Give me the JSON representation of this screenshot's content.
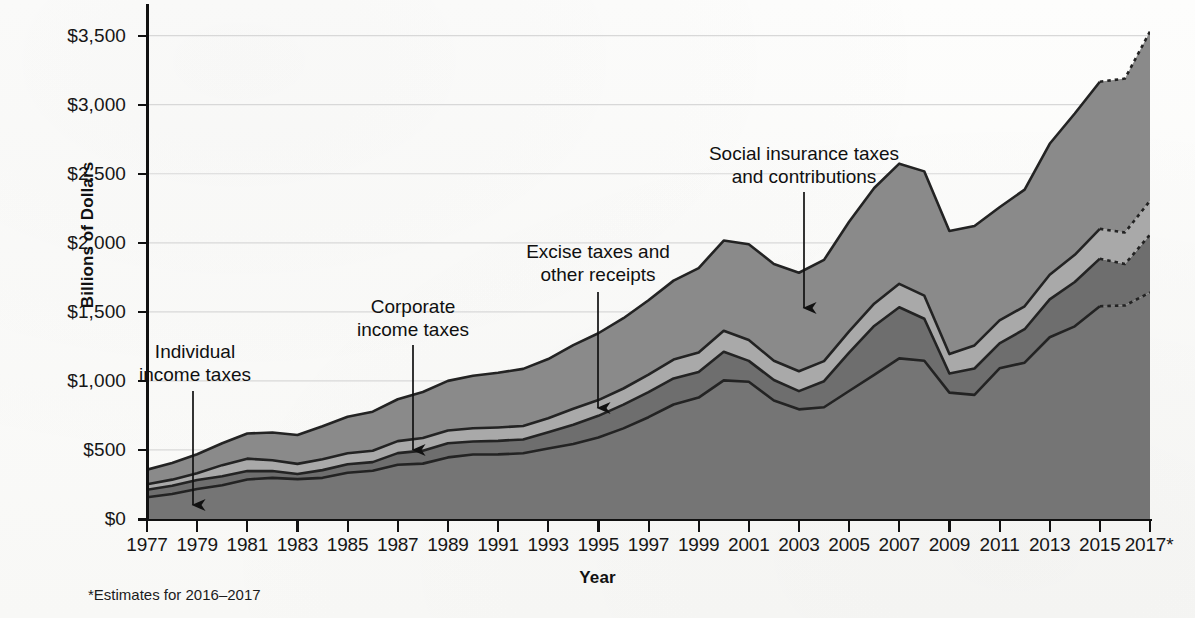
{
  "figure": {
    "axis_title_y": "Billions of Dollars",
    "axis_title_x": "Year",
    "footnote": "*Estimates for 2016–2017",
    "corner_mark": ""
  },
  "annotations": [
    {
      "id": "individual-income-taxes",
      "line1": "Individual",
      "line2": "income taxes"
    },
    {
      "id": "corporate-income-taxes",
      "line1": "Corporate",
      "line2": "income taxes"
    },
    {
      "id": "excise-taxes-and-other-receipts",
      "line1": "Excise taxes and",
      "line2": "other receipts"
    },
    {
      "id": "social-insurance-taxes-and-contributions",
      "line1": "Social insurance taxes",
      "line2": "and contributions"
    }
  ],
  "y_ticks": [
    {
      "label": "$0",
      "value": 0
    },
    {
      "label": "$500",
      "value": 500
    },
    {
      "label": "$1,000",
      "value": 1000
    },
    {
      "label": "$1,500",
      "value": 1500
    },
    {
      "label": "$2,000",
      "value": 2000
    },
    {
      "label": "$2,500",
      "value": 2500
    },
    {
      "label": "$3,000",
      "value": 3000
    },
    {
      "label": "$3,500",
      "value": 3500
    }
  ],
  "x_ticks": [
    "1977",
    "1979",
    "1981",
    "1983",
    "1985",
    "1987",
    "1989",
    "1991",
    "1993",
    "1995",
    "1997",
    "1999",
    "2001",
    "2003",
    "2005",
    "2007",
    "2009",
    "2011",
    "2013",
    "2015",
    "2017*"
  ],
  "colors": {
    "individual": "#757575",
    "corporate": "#6e6e6e",
    "excise": "#a9a9a9",
    "social": "#8a8a8a",
    "boundary": "#232323",
    "gridline": "#d8d8d8",
    "axis": "#111111",
    "background": "#fbfbfa"
  },
  "chart_data": {
    "type": "area",
    "stacked": true,
    "title": "",
    "xlabel": "Year",
    "ylabel": "Billions of Dollars",
    "ylim": [
      0,
      3700
    ],
    "xlim": [
      1977,
      2017
    ],
    "grid": true,
    "legend_position": "inline-annotations",
    "units": "Billions of Dollars",
    "estimate_years": [
      2016,
      2017
    ],
    "estimate_note": "*Estimates for 2016–2017",
    "x": [
      1977,
      1978,
      1979,
      1980,
      1981,
      1982,
      1983,
      1984,
      1985,
      1986,
      1987,
      1988,
      1989,
      1990,
      1991,
      1992,
      1993,
      1994,
      1995,
      1996,
      1997,
      1998,
      1999,
      2000,
      2001,
      2002,
      2003,
      2004,
      2005,
      2006,
      2007,
      2008,
      2009,
      2010,
      2011,
      2012,
      2013,
      2014,
      2015,
      2016,
      2017
    ],
    "series": [
      {
        "name": "Individual income taxes",
        "order": 1,
        "values": [
          157,
          181,
          217,
          244,
          286,
          298,
          289,
          298,
          335,
          349,
          393,
          401,
          446,
          467,
          468,
          476,
          510,
          543,
          590,
          656,
          737,
          829,
          879,
          1004,
          994,
          858,
          794,
          809,
          927,
          1044,
          1163,
          1146,
          915,
          899,
          1091,
          1132,
          1316,
          1395,
          1541,
          1546,
          1640
        ]
      },
      {
        "name": "Corporate income taxes",
        "order": 2,
        "values": [
          55,
          60,
          66,
          65,
          61,
          49,
          37,
          56,
          61,
          63,
          84,
          94,
          103,
          94,
          98,
          100,
          118,
          140,
          157,
          172,
          182,
          189,
          185,
          207,
          151,
          148,
          132,
          189,
          278,
          354,
          370,
          304,
          138,
          191,
          181,
          242,
          274,
          321,
          344,
          300,
          419
        ]
      },
      {
        "name": "Excise taxes and other receipts",
        "order": 3,
        "values": [
          39,
          44,
          48,
          81,
          90,
          78,
          73,
          79,
          80,
          82,
          87,
          91,
          92,
          96,
          97,
          97,
          102,
          115,
          114,
          117,
          126,
          136,
          141,
          152,
          151,
          140,
          144,
          145,
          153,
          161,
          170,
          167,
          141,
          167,
          166,
          166,
          179,
          197,
          216,
          228,
          245
        ]
      },
      {
        "name": "Social insurance taxes and contributions",
        "order": 4,
        "values": [
          106,
          121,
          138,
          158,
          182,
          201,
          209,
          239,
          265,
          283,
          303,
          334,
          359,
          380,
          396,
          414,
          428,
          461,
          484,
          509,
          539,
          572,
          612,
          653,
          694,
          701,
          713,
          733,
          794,
          838,
          870,
          900,
          891,
          865,
          819,
          845,
          948,
          1023,
          1065,
          1115,
          1226
        ]
      }
    ],
    "totals": [
      357,
      406,
      469,
      548,
      619,
      626,
      608,
      672,
      741,
      777,
      867,
      920,
      1000,
      1037,
      1059,
      1087,
      1158,
      1259,
      1345,
      1454,
      1584,
      1726,
      1817,
      2016,
      1990,
      1847,
      1783,
      1876,
      2152,
      2397,
      2573,
      2517,
      2085,
      2122,
      2257,
      2385,
      2717,
      2936,
      3166,
      3189,
      3530
    ],
    "notable_points": [
      {
        "year": 2000,
        "total": 2016,
        "note": "peak before 2001 recession"
      },
      {
        "year": 2003,
        "total": 1783,
        "note": "trough"
      },
      {
        "year": 2007,
        "total": 2573,
        "note": "pre-recession peak"
      },
      {
        "year": 2009,
        "total": 2085,
        "note": "recession trough"
      },
      {
        "year": 2017,
        "total": 3530,
        "note": "estimate"
      }
    ]
  }
}
